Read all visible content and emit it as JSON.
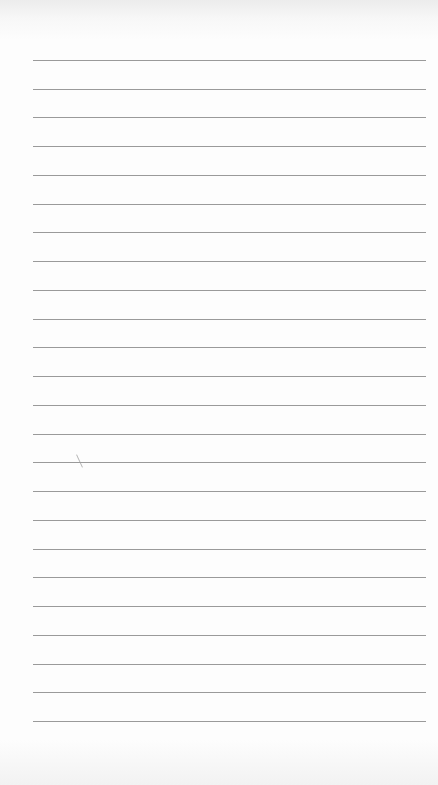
{
  "page": {
    "type": "lined-notebook-page",
    "line_count": 24,
    "first_line_y": 60,
    "line_spacing": 28.74,
    "line_left": 33,
    "line_width": 393,
    "line_color": "#9a9a9a",
    "background": "#fdfdfd"
  }
}
